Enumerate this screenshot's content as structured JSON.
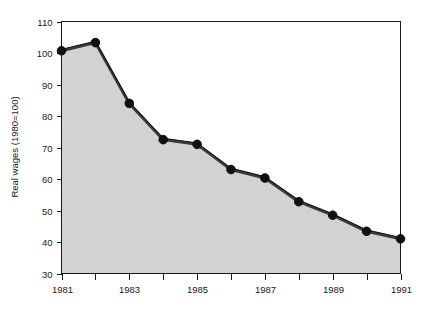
{
  "chart_data": {
    "type": "area",
    "title": "",
    "xlabel": "",
    "ylabel": "Real wages (1980=100)",
    "x": [
      1981,
      1982,
      1983,
      1984,
      1985,
      1986,
      1987,
      1988,
      1989,
      1990,
      1991
    ],
    "values": [
      100.7,
      103.3,
      84.0,
      72.5,
      71.0,
      63.0,
      60.3,
      52.8,
      48.5,
      43.4,
      41.0
    ],
    "series": [
      {
        "name": "Real wages",
        "values": [
          100.7,
          103.3,
          84.0,
          72.5,
          71.0,
          63.0,
          60.3,
          52.8,
          48.5,
          43.4,
          41.0
        ]
      }
    ],
    "xlim": [
      1981,
      1991
    ],
    "ylim": [
      30,
      110
    ],
    "yticks": [
      30,
      40,
      50,
      60,
      70,
      80,
      90,
      100,
      110
    ],
    "ytick_labels": [
      "30",
      "40",
      "50",
      "60",
      "70",
      "80",
      "90",
      "100",
      "110"
    ],
    "xticks": [
      1981,
      1982,
      1983,
      1984,
      1985,
      1986,
      1987,
      1988,
      1989,
      1990,
      1991
    ],
    "xtick_labels": [
      "1981",
      "",
      "1983",
      "",
      "1985",
      "",
      "1987",
      "",
      "1989",
      "",
      "1991"
    ],
    "xtick_labels_visible": [
      "1981",
      "1983",
      "1985",
      "1987",
      "1989",
      "1991"
    ],
    "grid": false,
    "legend": null,
    "legend_position": "none",
    "colors": {
      "area_fill": "#d2d2d2",
      "line": "#3a3a3a",
      "line_outline": "#111111",
      "marker": "#111111",
      "axis": "#1a1a1a",
      "background": "#ffffff"
    },
    "marker_style": "circle",
    "marker_size": 7
  }
}
